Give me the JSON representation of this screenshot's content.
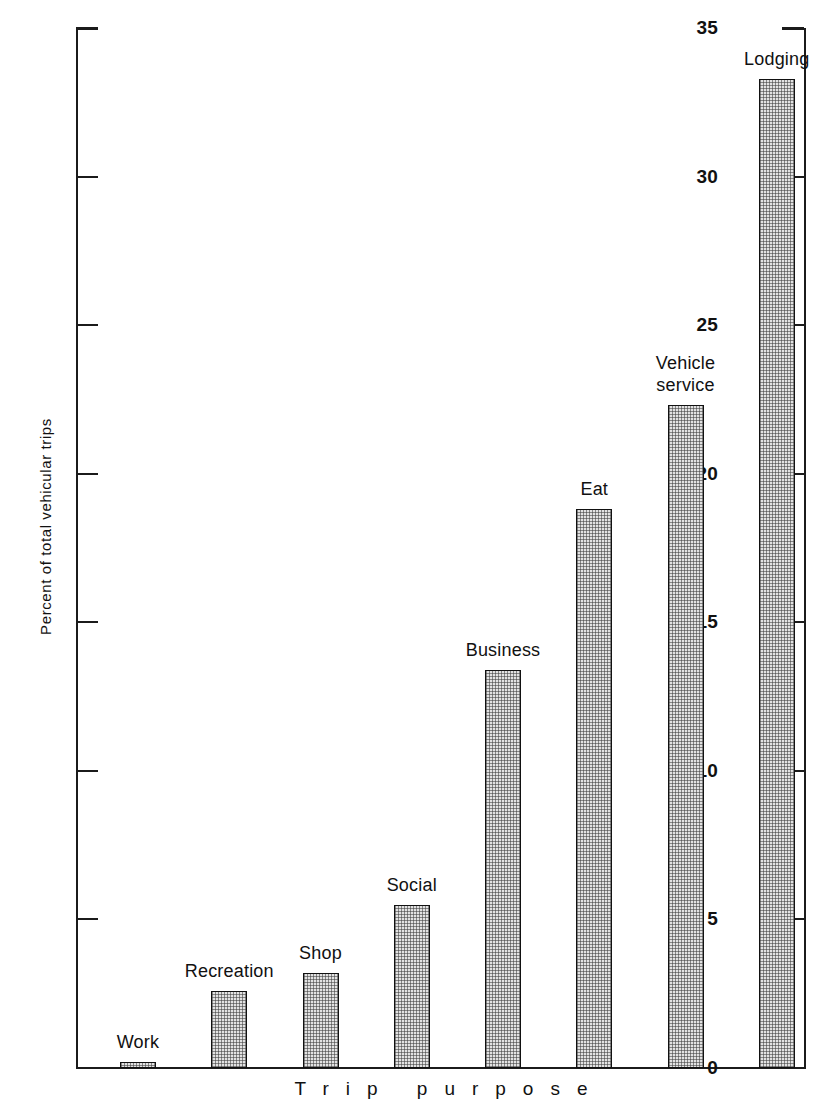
{
  "chart_data": {
    "type": "bar",
    "title": "",
    "xlabel": "Trip purpose",
    "ylabel": "Percent of total vehicular trips",
    "categories": [
      "Work",
      "Recreation",
      "Shop",
      "Social",
      "Business",
      "Eat",
      "Vehicle service",
      "Lodging"
    ],
    "values": [
      0.2,
      2.6,
      3.2,
      5.5,
      13.4,
      18.8,
      22.3,
      33.3
    ],
    "ylim": [
      0,
      35
    ],
    "yticks": [
      0,
      5,
      10,
      15,
      20,
      25,
      30,
      35
    ],
    "ytick_labels": [
      "0",
      "5",
      "10",
      "15",
      "20",
      "25",
      "30",
      "35"
    ],
    "grid": false,
    "legend": false,
    "bar_fill": "#e2e2e2",
    "bar_edge": "#111111",
    "axis_color": "#1b1b1b",
    "bar_labels_above": true
  },
  "axes": {
    "y_title": "Percent of total vehicular trips",
    "x_title": "Trip purpose"
  }
}
